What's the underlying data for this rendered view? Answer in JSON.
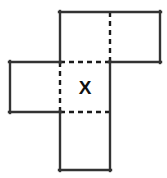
{
  "figure": {
    "name": "cube-net-diagram",
    "type": "geometry-net",
    "canvas": {
      "width": 167,
      "height": 178
    },
    "style": {
      "background_color": "#ffffff",
      "solid_line_color": "#333333",
      "dashed_line_color": "#1a1a1a",
      "solid_line_width": 2.4,
      "dashed_line_width": 2.4,
      "dash_pattern": "5,4"
    },
    "grid": {
      "cell_size": 50,
      "columns_x": [
        10,
        60,
        110,
        160
      ],
      "rows_y": [
        12,
        62,
        112,
        170
      ]
    },
    "labels": {
      "center_square": "X"
    },
    "squares": [
      {
        "name": "top-left-square",
        "x": 60,
        "y": 12,
        "w": 50,
        "h": 50,
        "edges": {
          "top": "solid",
          "right": "dashed",
          "bottom": "solid",
          "left": "solid"
        },
        "label": ""
      },
      {
        "name": "top-right-square",
        "x": 110,
        "y": 12,
        "w": 50,
        "h": 50,
        "edges": {
          "top": "solid",
          "right": "solid",
          "bottom": "solid",
          "left": "dashed"
        },
        "label": ""
      },
      {
        "name": "left-square",
        "x": 10,
        "y": 62,
        "w": 50,
        "h": 50,
        "edges": {
          "top": "solid",
          "right": "dashed",
          "bottom": "solid",
          "left": "solid"
        },
        "label": ""
      },
      {
        "name": "center-square",
        "x": 60,
        "y": 62,
        "w": 50,
        "h": 50,
        "edges": {
          "top": "dashed",
          "right": "solid",
          "bottom": "dashed",
          "left": "dashed"
        },
        "label": "X"
      },
      {
        "name": "bottom-square",
        "x": 60,
        "y": 112,
        "w": 50,
        "h": 58,
        "edges": {
          "top": "dashed",
          "right": "solid",
          "bottom": "solid",
          "left": "solid"
        },
        "label": ""
      }
    ],
    "solid_segments": [
      {
        "name": "top-row-top-edge",
        "x1": 60,
        "y1": 12,
        "x2": 160,
        "y2": 12
      },
      {
        "name": "top-left-square-left",
        "x1": 60,
        "y1": 12,
        "x2": 60,
        "y2": 62
      },
      {
        "name": "top-right-square-right",
        "x1": 160,
        "y1": 12,
        "x2": 160,
        "y2": 62
      },
      {
        "name": "top-right-square-bottom",
        "x1": 110,
        "y1": 62,
        "x2": 160,
        "y2": 62
      },
      {
        "name": "left-square-top",
        "x1": 10,
        "y1": 62,
        "x2": 60,
        "y2": 62
      },
      {
        "name": "left-square-left",
        "x1": 10,
        "y1": 62,
        "x2": 10,
        "y2": 112
      },
      {
        "name": "left-square-bottom",
        "x1": 10,
        "y1": 112,
        "x2": 60,
        "y2": 112
      },
      {
        "name": "center-column-right",
        "x1": 110,
        "y1": 62,
        "x2": 110,
        "y2": 170
      },
      {
        "name": "bottom-square-left",
        "x1": 60,
        "y1": 112,
        "x2": 60,
        "y2": 170
      },
      {
        "name": "bottom-square-bottom",
        "x1": 60,
        "y1": 170,
        "x2": 110,
        "y2": 170
      }
    ],
    "dashed_segments": [
      {
        "name": "top-row-divider",
        "x1": 110,
        "y1": 12,
        "x2": 110,
        "y2": 62
      },
      {
        "name": "center-square-top",
        "x1": 60,
        "y1": 62,
        "x2": 110,
        "y2": 62
      },
      {
        "name": "center-square-left",
        "x1": 60,
        "y1": 62,
        "x2": 60,
        "y2": 112
      },
      {
        "name": "center-square-bottom",
        "x1": 60,
        "y1": 112,
        "x2": 110,
        "y2": 112
      }
    ]
  }
}
